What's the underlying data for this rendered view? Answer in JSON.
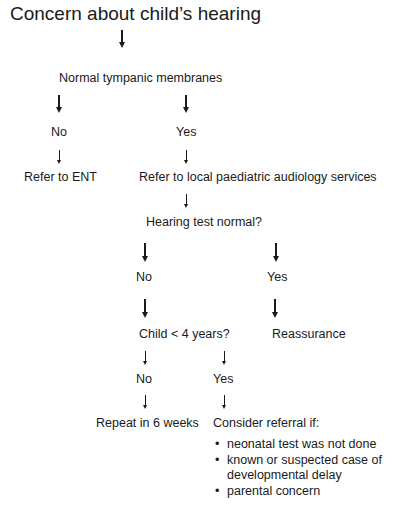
{
  "title": "Concern about child’s hearing",
  "nodes": {
    "tympanic": "Normal tympanic membranes",
    "tympanic_no": "No",
    "tympanic_yes": "Yes",
    "refer_ent": "Refer to ENT",
    "refer_audiology": "Refer to local paediatric audiology services",
    "hearing_test": "Hearing test normal?",
    "hearing_no": "No",
    "hearing_yes": "Yes",
    "child_age": "Child < 4 years?",
    "reassurance": "Reassurance",
    "age_no": "No",
    "age_yes": "Yes",
    "repeat": "Repeat in 6 weeks",
    "consider": "Consider referral if:"
  },
  "consider_items": [
    "neonatal test was not done",
    "known or suspected case of",
    "developmental delay",
    "parental concern"
  ]
}
